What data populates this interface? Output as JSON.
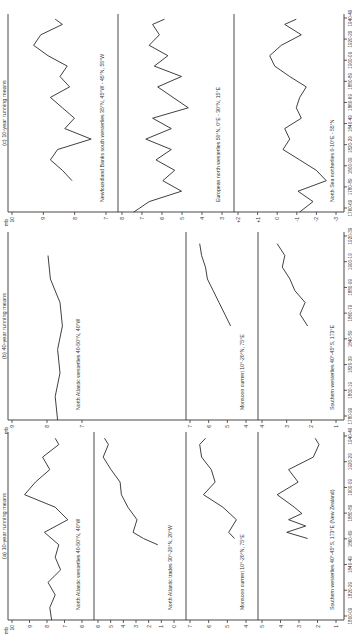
{
  "figure": {
    "unit_label": "mb",
    "panels": [
      {
        "id": "a",
        "caption": "(a) 10-year running means",
        "x_ticks": [
          "1800-09",
          "1820-29",
          "1840-49",
          "1860-69",
          "1880-89",
          "1900-09",
          "1920-29",
          "1940-49"
        ],
        "subplots": [
          {
            "title": "North Atlantic westerlies 40-50°N, 40°W",
            "y_ticks": [
              "10",
              "9",
              "8",
              "7",
              "6"
            ],
            "ylim": [
              6,
              10
            ]
          },
          {
            "title": "North Atlantic trades 30°-20°N, 20°W",
            "y_ticks": [
              "6",
              "5",
              "4",
              "3",
              "2",
              "1",
              "0"
            ],
            "ylim": [
              0,
              6
            ]
          },
          {
            "title": "Monsoon current 10°-20°N, 75°E",
            "y_ticks": [
              "7",
              "6",
              "5",
              "4"
            ],
            "ylim": [
              4,
              7
            ]
          },
          {
            "title": "Southern westerlies 40°-45°S, 173°E (New Zealand)",
            "y_ticks": [
              "5",
              "4",
              "3",
              "2",
              "1"
            ],
            "ylim": [
              1,
              5
            ]
          }
        ]
      },
      {
        "id": "b",
        "caption": "(b) 40-year running means",
        "x_ticks": [
          "1780-99",
          "1800-19",
          "1820-39",
          "1840-59",
          "1860-79",
          "1880-99",
          "1900-19",
          "1920-39"
        ],
        "subplots": [
          {
            "title": "North Atlantic westerlies 40-50°N, 40°W",
            "y_ticks": [
              "9",
              "8",
              "7"
            ],
            "ylim": [
              6.5,
              9.5
            ]
          },
          {
            "title": "Monsoon current 10°-20°N, 75°E",
            "y_ticks": [
              "7",
              "6",
              "5",
              "4"
            ],
            "ylim": [
              4,
              7
            ]
          },
          {
            "title": "Southern westerlies 40°-45°S, 173°E",
            "y_ticks": [
              "4",
              "3",
              "2",
              "1"
            ],
            "ylim": [
              1,
              4
            ]
          }
        ]
      },
      {
        "id": "c",
        "caption": "(c) 10-year running means",
        "x_ticks": [
          "1760-69",
          "1780-89",
          "1800-09",
          "1820-29",
          "1840-49",
          "1860-69",
          "1880-89",
          "1900-09",
          "1920-29",
          "1940-49"
        ],
        "subplots": [
          {
            "title": "Newfoundland Banks south westerlies 35°N, 45°W - 45°N, 55°W",
            "y_ticks": [
              "10",
              "9",
              "8",
              "7"
            ],
            "ylim": [
              6.5,
              10.5
            ]
          },
          {
            "title": "European north westerlies 50°N, 0°E - 30°N, 15°E",
            "y_ticks": [
              "8",
              "7",
              "6",
              "5",
              "4",
              "3"
            ],
            "ylim": [
              2.5,
              8.5
            ]
          },
          {
            "title": "North Sea northerlies 0-10°E - 55°N",
            "y_ticks": [
              "+2",
              "+1",
              "0",
              "-1",
              "-2",
              "-3"
            ],
            "ylim": [
              -3.5,
              2.5
            ]
          }
        ]
      }
    ]
  },
  "chart_data": [
    {
      "type": "line",
      "title": "(a) 10-year running means — North Atlantic westerlies 40-50°N, 40°W",
      "xlabel": "Decade",
      "ylabel": "mb",
      "x": [
        1800,
        1810,
        1820,
        1830,
        1840,
        1850,
        1860,
        1870,
        1880,
        1890,
        1900,
        1910,
        1920,
        1930,
        1940,
        1945
      ],
      "values": [
        7.8,
        7.9,
        7.6,
        8.0,
        7.3,
        7.6,
        7.4,
        8.2,
        6.9,
        7.6,
        9.3,
        8.7,
        7.9,
        8.3,
        7.4,
        7.6
      ],
      "ylim": [
        6,
        10
      ],
      "grid": false
    },
    {
      "type": "line",
      "title": "(a) 10-year running means — North Atlantic trades 30°-20°N, 20°W",
      "xlabel": "Decade",
      "ylabel": "mb",
      "x": [
        1860,
        1865,
        1870,
        1880,
        1890,
        1900,
        1910,
        1920,
        1930,
        1940,
        1945
      ],
      "values": [
        1.4,
        2.5,
        3.3,
        3.0,
        3.7,
        4.2,
        4.3,
        5.0,
        5.6,
        5.2,
        5.5
      ],
      "ylim": [
        0,
        6
      ],
      "grid": false
    },
    {
      "type": "line",
      "title": "(a) 10-year running means — Monsoon current 10°-20°N, 75°E",
      "xlabel": "Decade",
      "ylabel": "mb",
      "x": [
        1865,
        1870,
        1880,
        1890,
        1900,
        1910,
        1920,
        1930,
        1940,
        1945
      ],
      "values": [
        4.7,
        5.0,
        4.6,
        5.3,
        6.3,
        5.7,
        5.9,
        6.4,
        6.5,
        6.2
      ],
      "ylim": [
        4,
        7
      ],
      "grid": false
    },
    {
      "type": "line",
      "title": "(a) 10-year running means — Southern westerlies 40°-45°S, 173°E (New Zealand)",
      "xlabel": "Decade",
      "ylabel": "mb",
      "x": [
        1865,
        1870,
        1875,
        1880,
        1885,
        1890,
        1900,
        1910,
        1920,
        1930,
        1940,
        1945
      ],
      "values": [
        2.6,
        3.7,
        2.7,
        3.6,
        2.9,
        3.3,
        4.2,
        3.1,
        3.6,
        2.3,
        2.0,
        2.2
      ],
      "ylim": [
        1,
        5
      ],
      "grid": false
    },
    {
      "type": "line",
      "title": "(b) 40-year running means — North Atlantic westerlies 40-50°N, 40°W",
      "xlabel": "Period",
      "ylabel": "mb",
      "x": [
        1780,
        1800,
        1820,
        1840,
        1860,
        1880,
        1900,
        1920
      ],
      "values": [
        7.6,
        7.7,
        7.5,
        7.6,
        7.4,
        7.5,
        7.9,
        8.0
      ],
      "ylim": [
        6.5,
        9.5
      ],
      "grid": false
    },
    {
      "type": "line",
      "title": "(b) 40-year running means — Monsoon current 10°-20°N, 75°E",
      "xlabel": "Period",
      "ylabel": "mb",
      "x": [
        1860,
        1870,
        1880,
        1890,
        1900,
        1910,
        1920,
        1930
      ],
      "values": [
        4.9,
        5.2,
        5.5,
        5.8,
        6.1,
        6.2,
        6.4,
        6.5
      ],
      "ylim": [
        4,
        7
      ],
      "grid": false
    },
    {
      "type": "line",
      "title": "(b) 40-year running means — Southern westerlies 40°-45°S, 173°E",
      "xlabel": "Period",
      "ylabel": "mb",
      "x": [
        1860,
        1870,
        1880,
        1890,
        1900,
        1910,
        1920,
        1930
      ],
      "values": [
        2.2,
        2.5,
        2.3,
        2.7,
        2.9,
        3.2,
        3.1,
        3.4
      ],
      "ylim": [
        1,
        4
      ],
      "grid": false
    },
    {
      "type": "line",
      "title": "(c) 10-year running means — Newfoundland Banks south westerlies",
      "xlabel": "Decade",
      "ylabel": "mb",
      "x": [
        1790,
        1800,
        1810,
        1820,
        1830,
        1840,
        1850,
        1860,
        1870,
        1880,
        1890,
        1900,
        1910,
        1920,
        1930,
        1940,
        1945
      ],
      "values": [
        8.0,
        8.4,
        8.9,
        8.6,
        7.2,
        8.3,
        7.9,
        8.4,
        8.9,
        8.1,
        8.5,
        8.2,
        9.0,
        9.6,
        9.3,
        8.4,
        8.7
      ],
      "ylim": [
        6.5,
        10.5
      ],
      "grid": false
    },
    {
      "type": "line",
      "title": "(c) 10-year running means — European north westerlies",
      "xlabel": "Decade",
      "ylabel": "mb",
      "x": [
        1760,
        1770,
        1780,
        1790,
        1800,
        1810,
        1820,
        1830,
        1840,
        1850,
        1860,
        1870,
        1880,
        1890,
        1900,
        1910,
        1920,
        1930,
        1940,
        1945
      ],
      "values": [
        7.8,
        6.9,
        5.0,
        6.1,
        5.4,
        6.5,
        5.6,
        7.1,
        5.6,
        6.7,
        4.6,
        5.5,
        6.4,
        5.0,
        6.6,
        5.8,
        6.9,
        6.3,
        6.7,
        6.0
      ],
      "ylim": [
        2.5,
        8.5
      ],
      "grid": false
    },
    {
      "type": "line",
      "title": "(c) 10-year running means — North Sea northerlies",
      "xlabel": "Decade",
      "ylabel": "mb",
      "x": [
        1760,
        1770,
        1780,
        1790,
        1800,
        1810,
        1820,
        1830,
        1840,
        1850,
        1860,
        1870,
        1880,
        1890,
        1900,
        1910,
        1920,
        1930,
        1940,
        1945
      ],
      "values": [
        -1.2,
        -2.0,
        -1.1,
        -2.8,
        -2.2,
        -1.2,
        -0.2,
        -0.6,
        -0.3,
        -1.3,
        -1.0,
        -1.2,
        -1.6,
        -0.6,
        0.3,
        0.6,
        -0.1,
        -1.3,
        -0.3,
        -1.0
      ],
      "ylim": [
        -3.5,
        2.5
      ],
      "grid": false
    }
  ]
}
